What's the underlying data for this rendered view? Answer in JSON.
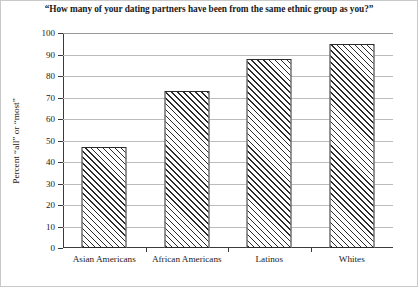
{
  "chart_data": {
    "type": "bar",
    "title": "“How many of your dating partners have been from the same ethnic group as you?”",
    "xlabel": "",
    "ylabel": "Percent “all” or “most”",
    "categories": [
      "Asian Americans",
      "African Americans",
      "Latinos",
      "Whites"
    ],
    "values": [
      47,
      73,
      88,
      95
    ],
    "ylim": [
      0,
      100
    ],
    "yticks": [
      0,
      10,
      20,
      30,
      40,
      50,
      60,
      70,
      80,
      90,
      100
    ],
    "ytick_labels": [
      "0",
      "10",
      "20",
      "30",
      "40",
      "50",
      "60",
      "70",
      "80",
      "90",
      "100"
    ],
    "grid": true,
    "legend": null,
    "bar_fill": "diagonal-hatch",
    "bar_color": "#2b2b2b",
    "gridline_color": "#bcbcbc"
  }
}
